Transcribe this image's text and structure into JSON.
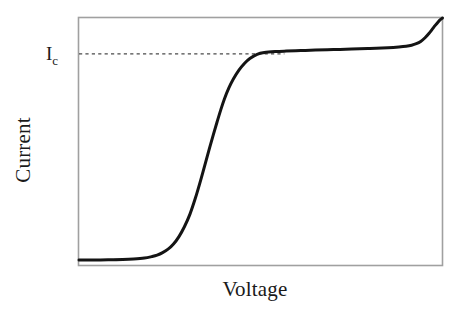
{
  "figure": {
    "background_color": "#ffffff",
    "frame_color": "#a0a0a0",
    "curve_color": "#141414",
    "dash_color": "#4a4a4a"
  },
  "labels": {
    "y_axis": "Current",
    "x_axis": "Voltage",
    "critical_current_symbol": "I",
    "critical_current_subscript": "c"
  },
  "chart_data": {
    "type": "line",
    "title": "",
    "subtitle": "",
    "xlabel": "Voltage",
    "ylabel": "Current",
    "xlim": [
      0,
      1
    ],
    "ylim": [
      0,
      1
    ],
    "grid": false,
    "legend": null,
    "xticks": [],
    "yticks": [],
    "ytick_labels": [
      "Ic"
    ],
    "annotations": [
      {
        "text": "Ic",
        "kind": "y-axis-level-label",
        "x": 0.0,
        "y": 0.855,
        "description": "Critical current level marked on the current axis"
      },
      {
        "text": "",
        "kind": "horizontal-dashed-reference-line",
        "y": 0.855,
        "x_start": 0.0,
        "x_end": 0.565,
        "description": "Dashed guide line from the Ic label across to the plateau of the curve"
      }
    ],
    "series": [
      {
        "name": "I-V characteristic",
        "color": "#141414",
        "x": [
          0.0,
          0.04,
          0.08,
          0.12,
          0.15,
          0.18,
          0.2,
          0.215,
          0.23,
          0.245,
          0.26,
          0.275,
          0.29,
          0.305,
          0.32,
          0.335,
          0.35,
          0.36,
          0.37,
          0.38,
          0.39,
          0.4,
          0.412,
          0.425,
          0.44,
          0.455,
          0.47,
          0.49,
          0.51,
          0.54,
          0.57,
          0.61,
          0.65,
          0.7,
          0.75,
          0.8,
          0.85,
          0.88,
          0.9,
          0.915,
          0.928,
          0.94,
          0.952,
          0.962,
          0.972,
          0.98,
          0.988,
          0.994,
          1.0
        ],
        "y": [
          0.02,
          0.02,
          0.021,
          0.022,
          0.024,
          0.028,
          0.034,
          0.04,
          0.05,
          0.064,
          0.085,
          0.115,
          0.155,
          0.205,
          0.27,
          0.345,
          0.425,
          0.478,
          0.53,
          0.58,
          0.628,
          0.672,
          0.716,
          0.754,
          0.789,
          0.816,
          0.836,
          0.853,
          0.86,
          0.864,
          0.866,
          0.868,
          0.87,
          0.872,
          0.874,
          0.877,
          0.88,
          0.883,
          0.886,
          0.89,
          0.896,
          0.905,
          0.92,
          0.936,
          0.955,
          0.97,
          0.984,
          0.993,
          1.0
        ]
      }
    ]
  }
}
